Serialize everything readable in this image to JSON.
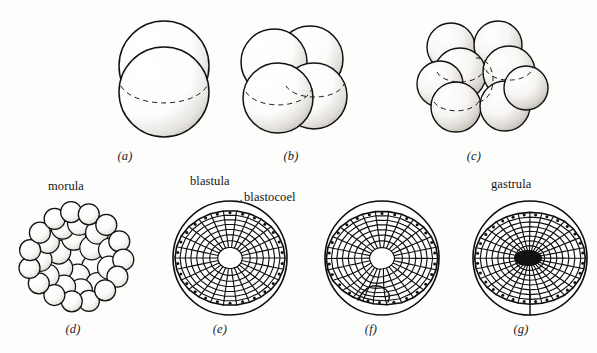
{
  "figure": {
    "background_color": "#fdfdfc",
    "ink_color": "#111111",
    "width": 597,
    "height": 353
  },
  "labels": {
    "morula": "morula",
    "blastula": "blastula",
    "blastocoel": "blastocoel",
    "gastrula": "gastrula"
  },
  "panels": [
    {
      "id": "a",
      "caption": "(a)",
      "stage_name": "two-cell stage",
      "cell_count": 2,
      "type": "spheres",
      "caption_x": 124,
      "caption_y": 151,
      "has_dashed_hidden_edge": true
    },
    {
      "id": "b",
      "caption": "(b)",
      "stage_name": "four-cell stage",
      "cell_count": 4,
      "type": "spheres",
      "caption_x": 290,
      "caption_y": 151,
      "has_dashed_hidden_edge": true
    },
    {
      "id": "c",
      "caption": "(c)",
      "stage_name": "eight-cell stage",
      "cell_count": 8,
      "type": "spheres",
      "caption_x": 473,
      "caption_y": 151,
      "has_dashed_hidden_edge": true
    },
    {
      "id": "d",
      "caption": "(d)",
      "stage_name": "morula",
      "cell_count": 40,
      "type": "cluster",
      "caption_x": 64,
      "caption_y": 323,
      "has_dashed_hidden_edge": false
    },
    {
      "id": "e",
      "caption": "(e)",
      "stage_name": "blastula",
      "type": "mesh-sphere",
      "caption_x": 211,
      "caption_y": 323,
      "has_dashed_hidden_edge": false
    },
    {
      "id": "f",
      "caption": "(f)",
      "stage_name": "early gastrulation",
      "type": "mesh-sphere-invaginating",
      "caption_x": 362,
      "caption_y": 323,
      "has_dashed_hidden_edge": false
    },
    {
      "id": "g",
      "caption": "(g)",
      "stage_name": "gastrula",
      "type": "mesh-sphere-gastrula",
      "caption_x": 512,
      "caption_y": 323,
      "has_dashed_hidden_edge": false
    }
  ],
  "annotations": [
    {
      "text_key": "morula",
      "x": 48,
      "y": 180,
      "anchor": "start"
    },
    {
      "text_key": "blastula",
      "x": 190,
      "y": 175,
      "anchor": "start"
    },
    {
      "text_key": "blastocoel",
      "x": 244,
      "y": 191,
      "anchor": "start"
    },
    {
      "text_key": "gastrula",
      "x": 491,
      "y": 178,
      "anchor": "start"
    }
  ],
  "leader_line": {
    "name": "blastocoel-leader",
    "x1": 242,
    "y1": 200,
    "x2": 224,
    "y2": 213
  }
}
